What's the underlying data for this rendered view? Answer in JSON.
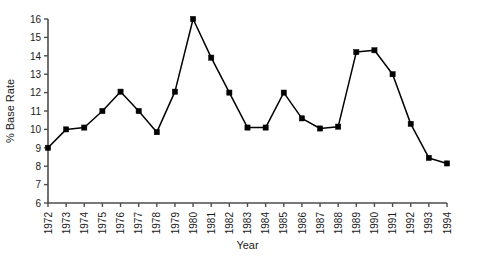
{
  "chart_data": {
    "type": "line",
    "title": "",
    "xlabel": "Year",
    "ylabel": "% Base Rate",
    "xlim": [
      1972,
      1994
    ],
    "ylim": [
      6,
      16
    ],
    "ytick_step": 1,
    "grid": false,
    "legend": "none",
    "marker": "filled-square",
    "line_color": "#000000",
    "marker_color": "#000000",
    "axis_color": "#4d4d4d",
    "background": "#ffffff",
    "categories": [
      "1972",
      "1973",
      "1974",
      "1975",
      "1976",
      "1977",
      "1978",
      "1979",
      "1980",
      "1981",
      "1982",
      "1983",
      "1984",
      "1985",
      "1986",
      "1987",
      "1988",
      "1989",
      "1990",
      "1991",
      "1992",
      "1993",
      "1994"
    ],
    "x": [
      1972,
      1973,
      1974,
      1975,
      1976,
      1977,
      1978,
      1979,
      1980,
      1981,
      1982,
      1983,
      1984,
      1985,
      1986,
      1987,
      1988,
      1989,
      1990,
      1991,
      1992,
      1993,
      1994
    ],
    "values": [
      9.0,
      10.0,
      10.1,
      11.0,
      12.05,
      11.0,
      9.85,
      12.05,
      16.0,
      13.9,
      12.0,
      10.1,
      10.1,
      12.0,
      10.6,
      10.05,
      10.15,
      14.2,
      14.3,
      13.0,
      10.3,
      8.45,
      8.15
    ],
    "yticks": [
      6,
      7,
      8,
      9,
      10,
      11,
      12,
      13,
      14,
      15,
      16
    ],
    "ytick_labels": [
      "6",
      "7",
      "8",
      "9",
      "10",
      "11",
      "12",
      "13",
      "14",
      "15",
      "16"
    ]
  }
}
